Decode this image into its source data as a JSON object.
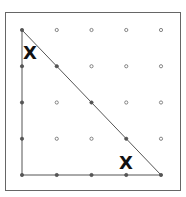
{
  "diagram": {
    "type": "geoboard",
    "grid": {
      "cols": 5,
      "rows": 5,
      "x0": 22,
      "y0": 30,
      "dx": 34.75,
      "dy": 36.25
    },
    "frame": {
      "x": 5,
      "y": 12,
      "width": 175,
      "height": 178,
      "stroke": "#666666"
    },
    "triangle": {
      "vertices_grid": [
        [
          0,
          0
        ],
        [
          0,
          4
        ],
        [
          4,
          4
        ]
      ],
      "stroke": "#555555"
    },
    "marks": [
      {
        "label": "X",
        "x": 23,
        "y": 44
      },
      {
        "label": "X",
        "x": 119,
        "y": 154
      }
    ],
    "dot_color": "#777777"
  }
}
